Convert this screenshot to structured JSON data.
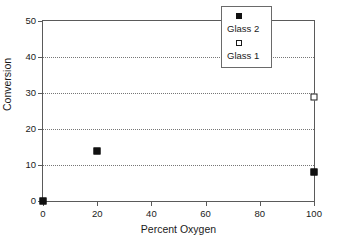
{
  "chart_data": {
    "type": "scatter",
    "title": "",
    "xlabel": "Percent Oxygen",
    "ylabel": "Conversion",
    "xlim": [
      0,
      100
    ],
    "ylim": [
      0,
      50
    ],
    "xticks": [
      0,
      20,
      40,
      60,
      80,
      100
    ],
    "yticks": [
      0,
      10,
      20,
      30,
      40,
      50
    ],
    "xtick_labels": [
      "0",
      "20",
      "40",
      "60",
      "80",
      "100"
    ],
    "ytick_labels": [
      "0",
      "10",
      "20",
      "30",
      "40",
      "50"
    ],
    "grid": {
      "horizontal": true,
      "vertical": false,
      "style": "dotted",
      "values": [
        10,
        20,
        30,
        40
      ]
    },
    "legend": {
      "position": "top-right-inside",
      "entries": [
        {
          "label": "Glass 2",
          "marker": "filled-square"
        },
        {
          "label": "Glass 1",
          "marker": "open-square"
        }
      ]
    },
    "series": [
      {
        "name": "Glass 2",
        "marker": "filled-square",
        "color": "#111111",
        "points": [
          {
            "x": 0,
            "y": 0
          },
          {
            "x": 20,
            "y": 14
          },
          {
            "x": 100,
            "y": 8
          }
        ]
      },
      {
        "name": "Glass 1",
        "marker": "open-square",
        "color": "#ffffff",
        "points": [
          {
            "x": 100,
            "y": 29
          }
        ]
      }
    ]
  },
  "colors": {
    "axis": "#5a5a5a",
    "grid": "#767676",
    "text": "#1a1a1a",
    "marker_filled": "#111111",
    "marker_open": "#ffffff",
    "background": "#ffffff"
  }
}
